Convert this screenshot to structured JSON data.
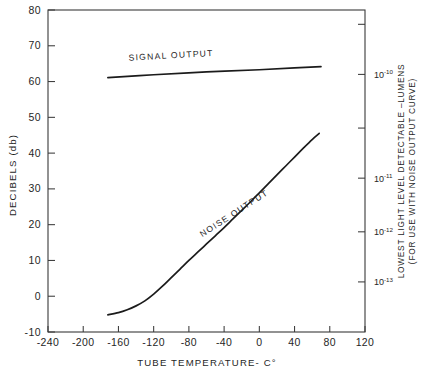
{
  "chart_data": {
    "type": "line",
    "title": "",
    "xlabel": "TUBE TEMPERATURE- C°",
    "ylabel": "DECIBELS (db)",
    "y2label_line1": "LOWEST LIGHT LEVEL DETECTABLE –LUMENS",
    "y2label_line2": "(FOR USE WITH NOISE OUTPUT CURVE)",
    "xlim": [
      -240,
      120
    ],
    "ylim": [
      -10,
      80
    ],
    "xticks": [
      -240,
      -200,
      -160,
      -120,
      -80,
      -40,
      0,
      40,
      80,
      120
    ],
    "xticklabels": [
      "-240",
      "-200",
      "-160",
      "-120",
      "-80",
      "-40",
      "0",
      "40",
      "80",
      "120"
    ],
    "yticks": [
      -10,
      0,
      10,
      20,
      30,
      40,
      50,
      60,
      70,
      80
    ],
    "yticklabels": [
      "-10",
      "0",
      "10",
      "20",
      "30",
      "40",
      "50",
      "60",
      "70",
      "80"
    ],
    "y2ticks_db": [
      76.0,
      62.0,
      47.0,
      33.0,
      18.0,
      4.0
    ],
    "y2ticklabels": [
      "",
      "10⁻¹⁰",
      "",
      "10⁻¹¹",
      "10⁻¹²",
      "10⁻¹³"
    ],
    "y2_labeled": [
      {
        "db": 62.0,
        "base": "10",
        "exp": "-10"
      },
      {
        "db": 33.0,
        "base": "10",
        "exp": "-11"
      },
      {
        "db": 18.0,
        "base": "10",
        "exp": "-12"
      },
      {
        "db": 4.0,
        "base": "10",
        "exp": "-13"
      }
    ],
    "y2_tick_positions_db": [
      76.0,
      62.0,
      47.0,
      33.0,
      18.0,
      4.0
    ],
    "grid": false,
    "legend_position": "inline-annotations",
    "series": [
      {
        "name": "SIGNAL OUTPUT",
        "label_x": -100,
        "label_y": 66.5,
        "label_rotation": -3.2,
        "points": [
          {
            "x": -172,
            "y": 61.1
          },
          {
            "x": -120,
            "y": 61.9
          },
          {
            "x": -60,
            "y": 62.7
          },
          {
            "x": 0,
            "y": 63.3
          },
          {
            "x": 40,
            "y": 63.8
          },
          {
            "x": 70,
            "y": 64.2
          }
        ]
      },
      {
        "name": "NOISE OUTPUT",
        "label_x": -27,
        "label_y": 22.5,
        "label_rotation": -33.0,
        "points": [
          {
            "x": -172,
            "y": -5.2
          },
          {
            "x": -160,
            "y": -4.6
          },
          {
            "x": -150,
            "y": -3.8
          },
          {
            "x": -140,
            "y": -2.7
          },
          {
            "x": -130,
            "y": -1.3
          },
          {
            "x": -120,
            "y": 0.6
          },
          {
            "x": -110,
            "y": 2.8
          },
          {
            "x": -100,
            "y": 5.2
          },
          {
            "x": -90,
            "y": 7.6
          },
          {
            "x": -80,
            "y": 10.0
          },
          {
            "x": -70,
            "y": 12.3
          },
          {
            "x": -60,
            "y": 14.6
          },
          {
            "x": -50,
            "y": 16.9
          },
          {
            "x": -40,
            "y": 19.2
          },
          {
            "x": -30,
            "y": 21.6
          },
          {
            "x": -20,
            "y": 24.0
          },
          {
            "x": -10,
            "y": 26.4
          },
          {
            "x": 0,
            "y": 28.9
          },
          {
            "x": 10,
            "y": 31.4
          },
          {
            "x": 20,
            "y": 33.9
          },
          {
            "x": 30,
            "y": 36.4
          },
          {
            "x": 40,
            "y": 38.9
          },
          {
            "x": 50,
            "y": 41.4
          },
          {
            "x": 60,
            "y": 43.8
          },
          {
            "x": 68,
            "y": 45.5
          }
        ]
      }
    ]
  },
  "caption": {
    "text": ""
  },
  "colors": {
    "curve": "#1b1b1b",
    "frame": "#3a3a3a",
    "text": "#1f1f1f",
    "background": "#ffffff"
  }
}
